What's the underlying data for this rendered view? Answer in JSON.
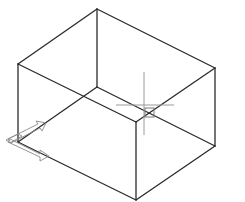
{
  "viewport": {
    "background": "#ffffff",
    "edge_color": "#2a2a2a",
    "crosshair_color": "#9a9a9a",
    "ucs_color": "#8a8a8a"
  },
  "box": {
    "vertices": {
      "top_back": [
        97,
        9
      ],
      "top_left": [
        18,
        64
      ],
      "top_right": [
        215,
        68
      ],
      "top_front": [
        136,
        122
      ],
      "bottom_left": [
        18,
        142
      ],
      "bottom_right": [
        215,
        146
      ],
      "bottom_front": [
        136,
        200
      ],
      "bottom_back": [
        97,
        87
      ]
    }
  },
  "crosshair": {
    "x": 144,
    "y": 105,
    "pickbox_size": 10
  },
  "ucs_icon": {
    "origin": [
      18,
      142
    ]
  }
}
